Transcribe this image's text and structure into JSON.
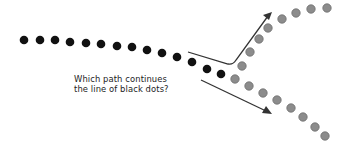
{
  "diagram": {
    "question_lines": [
      "Which path continues",
      "the line of black dots?"
    ],
    "colors": {
      "black_dot": "#111111",
      "gray_dot": "#8c8c8c",
      "gray_dot_stroke": "#6f6f6f",
      "arrow": "#333333",
      "background": "#ffffff"
    },
    "black_dots": [
      [
        24,
        40
      ],
      [
        40,
        40
      ],
      [
        55,
        40
      ],
      [
        70,
        42
      ],
      [
        86,
        43
      ],
      [
        101,
        44
      ],
      [
        117,
        46
      ],
      [
        132,
        47
      ],
      [
        147,
        50
      ],
      [
        162,
        53
      ],
      [
        177,
        57
      ],
      [
        192,
        62
      ],
      [
        207,
        69
      ],
      [
        221,
        74
      ]
    ],
    "upper_gray_dots": [
      [
        242,
        66
      ],
      [
        250,
        52
      ],
      [
        259,
        39
      ],
      [
        268,
        28
      ],
      [
        282,
        19
      ],
      [
        296,
        13
      ],
      [
        311,
        9
      ],
      [
        327,
        8
      ]
    ],
    "lower_gray_dots": [
      [
        235,
        79
      ],
      [
        249,
        86
      ],
      [
        263,
        93
      ],
      [
        277,
        100
      ],
      [
        291,
        108
      ],
      [
        303,
        117
      ],
      [
        315,
        127
      ],
      [
        325,
        136
      ]
    ],
    "upper_arrow_path": "M188,52 L228,64 Q233,65 236,60 L268,16",
    "upper_arrow_head": "272,12 263,15 269,20",
    "lower_arrow_path": "M201,80 L266,111",
    "lower_arrow_head": "272,114 262,113 266,106"
  }
}
